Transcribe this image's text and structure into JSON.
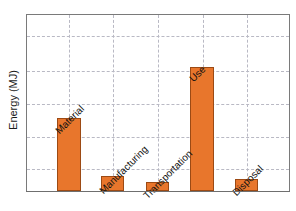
{
  "chart_data": {
    "type": "bar",
    "title": "",
    "xlabel": "",
    "ylabel": "Energy (MJ)",
    "categories": [
      "Material",
      "Manufacturing",
      "Transportation",
      "Use",
      "Disposal"
    ],
    "values": [
      41,
      8,
      5,
      70,
      7
    ],
    "ylim": [
      0,
      100
    ],
    "grid": true,
    "gridlines_y": [
      18,
      37,
      55,
      73,
      91
    ],
    "legend": "none",
    "bar_color": "#E8762C",
    "bar_edge_color": "#9C4A14",
    "grid_color": "#B9B9C4",
    "axis_color": "#7A7A7A",
    "label_rotation": "-45",
    "axis_tick_labels_y": [],
    "axis_tick_labels_x": []
  },
  "axes": {
    "y_title": "Energy (MJ)"
  },
  "bars": [
    {
      "label": "Material",
      "value": 41,
      "left_pct": 11.4,
      "width_pct": 9.1,
      "height_pct": 41.6
    },
    {
      "label": "Manufacturing",
      "value": 8,
      "left_pct": 28.4,
      "width_pct": 8.7,
      "height_pct": 8.4
    },
    {
      "label": "Transportation",
      "value": 5,
      "left_pct": 45.5,
      "width_pct": 8.7,
      "height_pct": 5.1
    },
    {
      "label": "Use",
      "value": 70,
      "left_pct": 62.1,
      "width_pct": 9.1,
      "height_pct": 70.2
    },
    {
      "label": "Disposal",
      "value": 7,
      "left_pct": 79.5,
      "width_pct": 8.7,
      "height_pct": 6.7
    }
  ],
  "label_positions": [
    {
      "label": "Material",
      "left_pct": 12.9,
      "top_px": 110
    },
    {
      "label": "Manufacturing",
      "left_pct": 29.9,
      "top_px": 170
    },
    {
      "label": "Transportation",
      "left_pct": 46.6,
      "top_px": 175
    },
    {
      "label": "Use",
      "left_pct": 64.0,
      "top_px": 58
    },
    {
      "label": "Disposal",
      "left_pct": 80.7,
      "top_px": 172
    }
  ],
  "grid_y_px": [
    21,
    56,
    89,
    122,
    154
  ],
  "grid_x_pct": [
    15.9,
    32.9,
    50.0,
    67.0,
    84.1
  ]
}
